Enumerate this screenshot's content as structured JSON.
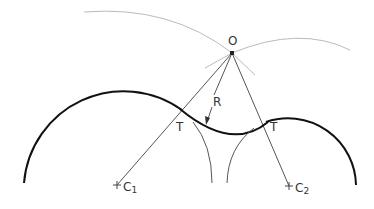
{
  "diagram": {
    "labels": {
      "center_point": "O",
      "radius": "R",
      "tangent_left": "T",
      "tangent_right": "T",
      "center_1_letter": "C",
      "center_1_sub": "1",
      "center_2_letter": "C",
      "center_2_sub": "2"
    },
    "colors": {
      "heavy_line": "#111111",
      "construction_line": "#555555",
      "light_arc": "#bbbbbb",
      "text": "#333333"
    }
  }
}
